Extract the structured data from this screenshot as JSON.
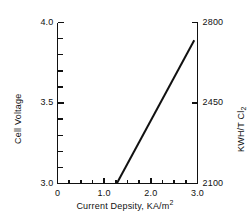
{
  "chart_data": {
    "type": "line",
    "title": "",
    "xlabel": "Current Depsity, KA/m",
    "xlabel_sup": "2",
    "ylabel_left": "Cell Voltage",
    "ylabel_right_main": "KWH/T Cl",
    "ylabel_right_sub": "2",
    "xlim": [
      0,
      3.0
    ],
    "ylim_left": [
      3.0,
      4.0
    ],
    "ylim_right": [
      2100,
      2800
    ],
    "grid": false,
    "legend": "none",
    "x_ticks_major": [
      "0",
      "1.0",
      "2.0",
      "3.0"
    ],
    "x_ticks_major_values": [
      0,
      1.0,
      2.0,
      3.0
    ],
    "x_ticks_minor_values": [
      0.25,
      0.5,
      0.75,
      1.25,
      1.5,
      1.75,
      2.25,
      2.5,
      2.75
    ],
    "y_left_ticks_major": [
      "4.0",
      "3.5",
      "3.0"
    ],
    "y_left_ticks_major_values": [
      4.0,
      3.5,
      3.0
    ],
    "y_left_ticks_minor_values": [
      3.1,
      3.2,
      3.3,
      3.4,
      3.6,
      3.7,
      3.8,
      3.9
    ],
    "y_right_ticks_major": [
      "2800",
      "2450",
      "2100"
    ],
    "y_right_ticks_major_values": [
      2800,
      2450,
      2100
    ],
    "series": [
      {
        "name": "cell-voltage-vs-current-density",
        "x": [
          1.27,
          2.93
        ],
        "y": [
          3.0,
          3.89
        ],
        "y_right": [
          2100,
          2723
        ],
        "style": "solid-line",
        "color": "#111111",
        "width": 2.0
      }
    ],
    "colors": {
      "ink": "#111111",
      "background": "#ffffff",
      "line": "#111111"
    }
  }
}
